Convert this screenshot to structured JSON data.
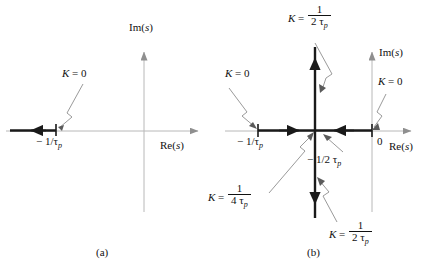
{
  "figure": {
    "type": "root-locus-diagram",
    "panels": [
      {
        "id": "a",
        "caption": "(a)",
        "axes": {
          "imaginary_label": "Im(s)",
          "imaginary_label_italic": "s",
          "real_label": "Re(s)",
          "real_label_italic": "s"
        },
        "annotations": [
          {
            "name": "k-zero-left",
            "text_lead": "K",
            "text_eq": " = 0",
            "value": "K = 0",
            "target": "open-loop pole at -1/tau_p"
          }
        ],
        "axis_ticks": [
          {
            "name": "pole-minus-one-over-tau-p",
            "text": "− 1/τ",
            "sub": "p",
            "full": "−1/τp"
          }
        ],
        "locus": {
          "description": "bold real-axis branch from -1/tau_p going to minus infinity",
          "direction": "left"
        }
      },
      {
        "id": "b",
        "caption": "(b)",
        "axes": {
          "imaginary_label": "Im(s)",
          "imaginary_label_italic": "s",
          "real_label": "Re(s)",
          "real_label_italic": "s"
        },
        "annotations": [
          {
            "name": "k-top-breakaway",
            "text_lead": "K",
            "text_eq": " = ",
            "num": "1",
            "den": "2 τ",
            "den_sub": "p",
            "value": "K = 1/(2τp)",
            "target": "upper vertical branch"
          },
          {
            "name": "k-zero-left",
            "text_lead": "K",
            "text_eq": " = 0",
            "value": "K = 0",
            "target": "pole at -1/tau_p"
          },
          {
            "name": "k-zero-right",
            "text_lead": "K",
            "text_eq": " = 0",
            "value": "K = 0",
            "target": "pole at origin"
          },
          {
            "name": "k-breakaway",
            "text_lead": "K",
            "text_eq": " = ",
            "num": "1",
            "den": "4 τ",
            "den_sub": "p",
            "value": "K = 1/(4τp)",
            "target": "breakaway point at -1/(2 tau_p)"
          },
          {
            "name": "k-bottom-branch",
            "text_lead": "K",
            "text_eq": " = ",
            "num": "1",
            "den": "2 τ",
            "den_sub": "p",
            "value": "K = 1/(2τp)",
            "target": "lower vertical branch"
          }
        ],
        "axis_ticks": [
          {
            "name": "pole-minus-one-over-tau-p",
            "text": "− 1/τ",
            "sub": "p",
            "full": "−1/τp"
          },
          {
            "name": "breakaway-minus-half-tau-p",
            "text": "− 1/2 τ",
            "sub": "p",
            "full": "−1/2τp"
          },
          {
            "name": "origin-zero",
            "text": "0",
            "full": "0"
          }
        ],
        "locus": {
          "description": "bold real-axis segment between -1/tau_p and 0, plus vertical branch at Re(s) = -1/(2 tau_p)",
          "vertical_branch_real_part": "-1/(2 tau_p)"
        }
      }
    ],
    "colors": {
      "axis": "#b8b8b8",
      "locus": "#1a1a1a",
      "leader": "#9a9a9a",
      "text": "#111111"
    }
  }
}
